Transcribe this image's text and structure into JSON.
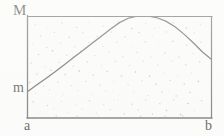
{
  "figure": {
    "labels": {
      "max_label": "M",
      "min_label": "m",
      "left_endpoint_label": "a",
      "right_endpoint_label": "b"
    },
    "colors": {
      "curve": "#3a3a3a",
      "frame": "#4a4a4a",
      "stipple": "#9a9a9a",
      "background": "#fefefe",
      "text": "#161616"
    }
  },
  "chart_data": {
    "type": "line",
    "title": "",
    "xlabel": "",
    "ylabel": "",
    "xlim": [
      0,
      1
    ],
    "ylim": [
      0,
      1
    ],
    "grid": false,
    "legend": "none",
    "axis_tick_labels": {
      "x": [
        "a",
        "b"
      ],
      "y": [
        "m",
        "M"
      ]
    },
    "annotations": [
      {
        "text": "M",
        "position": "top-left-outside",
        "meaning": "maximum value of f on [a,b]"
      },
      {
        "text": "m",
        "position": "left-outside",
        "meaning": "minimum value of f on [a,b]"
      },
      {
        "text": "a",
        "position": "bottom-left-outside",
        "meaning": "left endpoint of interval"
      },
      {
        "text": "b",
        "position": "bottom-right-outside",
        "meaning": "right endpoint of interval"
      }
    ],
    "series": [
      {
        "name": "f(x)",
        "x": [
          0.0,
          0.05,
          0.1,
          0.15,
          0.2,
          0.25,
          0.3,
          0.35,
          0.4,
          0.45,
          0.5,
          0.55,
          0.6,
          0.65,
          0.7,
          0.75,
          0.8,
          0.85,
          0.9,
          0.95,
          1.0
        ],
        "y": [
          0.255,
          0.32,
          0.385,
          0.45,
          0.52,
          0.59,
          0.66,
          0.73,
          0.8,
          0.87,
          0.935,
          0.98,
          1.0,
          1.0,
          0.985,
          0.95,
          0.895,
          0.82,
          0.735,
          0.645,
          0.57
        ]
      }
    ],
    "reference_lines": [
      {
        "axis": "y",
        "value": 1.0,
        "label": "M"
      },
      {
        "axis": "y",
        "value": 0.255,
        "label": "m"
      },
      {
        "axis": "x",
        "value": 0.0,
        "label": "a"
      },
      {
        "axis": "x",
        "value": 1.0,
        "label": "b"
      }
    ],
    "region_fill": "stippled",
    "stipple_points": [
      [
        0.045,
        0.915
      ],
      [
        0.112,
        0.872
      ],
      [
        0.19,
        0.93
      ],
      [
        0.268,
        0.888
      ],
      [
        0.338,
        0.936
      ],
      [
        0.415,
        0.902
      ],
      [
        0.492,
        0.94
      ],
      [
        0.566,
        0.878
      ],
      [
        0.64,
        0.925
      ],
      [
        0.716,
        0.89
      ],
      [
        0.79,
        0.934
      ],
      [
        0.862,
        0.88
      ],
      [
        0.936,
        0.92
      ],
      [
        0.072,
        0.806
      ],
      [
        0.148,
        0.84
      ],
      [
        0.228,
        0.792
      ],
      [
        0.302,
        0.836
      ],
      [
        0.38,
        0.8
      ],
      [
        0.455,
        0.842
      ],
      [
        0.53,
        0.796
      ],
      [
        0.606,
        0.838
      ],
      [
        0.68,
        0.802
      ],
      [
        0.754,
        0.844
      ],
      [
        0.83,
        0.798
      ],
      [
        0.905,
        0.836
      ],
      [
        0.03,
        0.726
      ],
      [
        0.106,
        0.69
      ],
      [
        0.182,
        0.734
      ],
      [
        0.258,
        0.698
      ],
      [
        0.334,
        0.74
      ],
      [
        0.41,
        0.702
      ],
      [
        0.486,
        0.744
      ],
      [
        0.562,
        0.706
      ],
      [
        0.638,
        0.748
      ],
      [
        0.712,
        0.71
      ],
      [
        0.788,
        0.752
      ],
      [
        0.864,
        0.714
      ],
      [
        0.94,
        0.742
      ],
      [
        0.062,
        0.622
      ],
      [
        0.138,
        0.66
      ],
      [
        0.214,
        0.616
      ],
      [
        0.29,
        0.654
      ],
      [
        0.366,
        0.61
      ],
      [
        0.442,
        0.648
      ],
      [
        0.518,
        0.604
      ],
      [
        0.594,
        0.642
      ],
      [
        0.67,
        0.6
      ],
      [
        0.746,
        0.638
      ],
      [
        0.822,
        0.596
      ],
      [
        0.898,
        0.634
      ],
      [
        0.022,
        0.54
      ],
      [
        0.098,
        0.502
      ],
      [
        0.174,
        0.546
      ],
      [
        0.25,
        0.508
      ],
      [
        0.326,
        0.55
      ],
      [
        0.402,
        0.512
      ],
      [
        0.478,
        0.554
      ],
      [
        0.554,
        0.516
      ],
      [
        0.63,
        0.558
      ],
      [
        0.706,
        0.52
      ],
      [
        0.782,
        0.56
      ],
      [
        0.858,
        0.522
      ],
      [
        0.934,
        0.552
      ],
      [
        0.054,
        0.432
      ],
      [
        0.13,
        0.468
      ],
      [
        0.206,
        0.426
      ],
      [
        0.282,
        0.462
      ],
      [
        0.358,
        0.42
      ],
      [
        0.434,
        0.456
      ],
      [
        0.51,
        0.414
      ],
      [
        0.586,
        0.45
      ],
      [
        0.662,
        0.41
      ],
      [
        0.738,
        0.446
      ],
      [
        0.814,
        0.406
      ],
      [
        0.89,
        0.442
      ],
      [
        0.014,
        0.348
      ],
      [
        0.09,
        0.312
      ],
      [
        0.166,
        0.354
      ],
      [
        0.242,
        0.318
      ],
      [
        0.318,
        0.358
      ],
      [
        0.394,
        0.322
      ],
      [
        0.47,
        0.362
      ],
      [
        0.546,
        0.326
      ],
      [
        0.622,
        0.366
      ],
      [
        0.698,
        0.33
      ],
      [
        0.774,
        0.368
      ],
      [
        0.85,
        0.332
      ],
      [
        0.926,
        0.36
      ],
      [
        0.046,
        0.242
      ],
      [
        0.122,
        0.278
      ],
      [
        0.198,
        0.236
      ],
      [
        0.274,
        0.272
      ],
      [
        0.35,
        0.23
      ],
      [
        0.426,
        0.266
      ],
      [
        0.502,
        0.224
      ],
      [
        0.578,
        0.26
      ],
      [
        0.654,
        0.22
      ],
      [
        0.73,
        0.256
      ],
      [
        0.806,
        0.216
      ],
      [
        0.882,
        0.252
      ],
      [
        0.034,
        0.158
      ],
      [
        0.11,
        0.122
      ],
      [
        0.186,
        0.164
      ],
      [
        0.262,
        0.128
      ],
      [
        0.338,
        0.168
      ],
      [
        0.414,
        0.132
      ],
      [
        0.49,
        0.172
      ],
      [
        0.566,
        0.136
      ],
      [
        0.642,
        0.176
      ],
      [
        0.718,
        0.14
      ],
      [
        0.794,
        0.178
      ],
      [
        0.87,
        0.142
      ],
      [
        0.944,
        0.17
      ],
      [
        0.07,
        0.058
      ],
      [
        0.146,
        0.092
      ],
      [
        0.222,
        0.052
      ],
      [
        0.298,
        0.088
      ],
      [
        0.374,
        0.046
      ],
      [
        0.45,
        0.082
      ],
      [
        0.526,
        0.042
      ],
      [
        0.602,
        0.078
      ],
      [
        0.678,
        0.038
      ],
      [
        0.754,
        0.074
      ],
      [
        0.83,
        0.034
      ],
      [
        0.906,
        0.07
      ],
      [
        0.158,
        0.018
      ],
      [
        0.386,
        0.02
      ],
      [
        0.614,
        0.016
      ],
      [
        0.842,
        0.022
      ],
      [
        0.25,
        0.6
      ],
      [
        0.47,
        0.18
      ],
      [
        0.69,
        0.88
      ],
      [
        0.12,
        0.4
      ]
    ]
  }
}
